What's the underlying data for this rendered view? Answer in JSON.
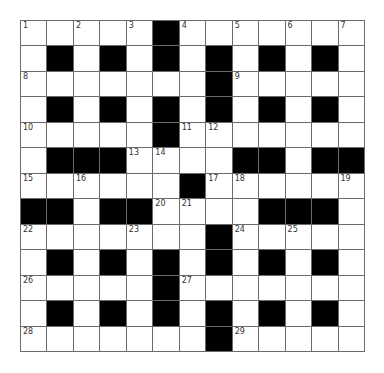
{
  "puzzle": {
    "rows": 13,
    "cols": 13,
    "layout": [
      ".....#.......",
      ".#.#.#.#.#.#.",
      ".......#.....",
      ".#.#.#.#.#.#.",
      ".....#.......",
      ".###....##.##",
      "......#......",
      "##.##....###.",
      ".......#.....",
      ".#.#.#.#.#.#.",
      ".....#.......",
      ".#.#.#.#.#.#.",
      ".......#....."
    ],
    "numbers": [
      {
        "row": 0,
        "col": 0,
        "n": "1"
      },
      {
        "row": 0,
        "col": 2,
        "n": "2"
      },
      {
        "row": 0,
        "col": 4,
        "n": "3"
      },
      {
        "row": 0,
        "col": 6,
        "n": "4"
      },
      {
        "row": 0,
        "col": 8,
        "n": "5"
      },
      {
        "row": 0,
        "col": 10,
        "n": "6"
      },
      {
        "row": 0,
        "col": 12,
        "n": "7"
      },
      {
        "row": 2,
        "col": 0,
        "n": "8"
      },
      {
        "row": 2,
        "col": 8,
        "n": "9"
      },
      {
        "row": 4,
        "col": 0,
        "n": "10"
      },
      {
        "row": 4,
        "col": 6,
        "n": "11"
      },
      {
        "row": 4,
        "col": 7,
        "n": "12"
      },
      {
        "row": 5,
        "col": 4,
        "n": "13"
      },
      {
        "row": 5,
        "col": 5,
        "n": "14"
      },
      {
        "row": 6,
        "col": 0,
        "n": "15"
      },
      {
        "row": 6,
        "col": 2,
        "n": "16"
      },
      {
        "row": 6,
        "col": 7,
        "n": "17"
      },
      {
        "row": 6,
        "col": 8,
        "n": "18"
      },
      {
        "row": 6,
        "col": 12,
        "n": "19"
      },
      {
        "row": 7,
        "col": 5,
        "n": "20"
      },
      {
        "row": 7,
        "col": 6,
        "n": "21"
      },
      {
        "row": 8,
        "col": 0,
        "n": "22"
      },
      {
        "row": 8,
        "col": 4,
        "n": "23"
      },
      {
        "row": 8,
        "col": 8,
        "n": "24"
      },
      {
        "row": 8,
        "col": 10,
        "n": "25"
      },
      {
        "row": 10,
        "col": 0,
        "n": "26"
      },
      {
        "row": 10,
        "col": 6,
        "n": "27"
      },
      {
        "row": 12,
        "col": 0,
        "n": "28"
      },
      {
        "row": 12,
        "col": 8,
        "n": "29"
      }
    ],
    "colors": {
      "block": "#000000",
      "cell": "#ffffff",
      "gridline": "#6a6a6a",
      "number": "#333333"
    }
  }
}
